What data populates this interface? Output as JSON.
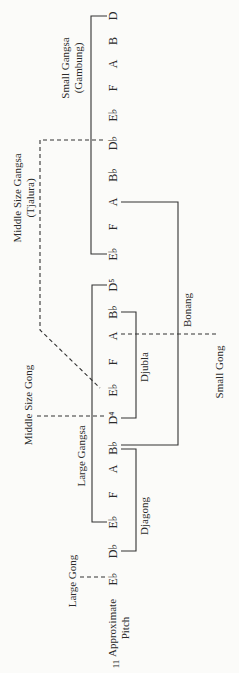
{
  "page_number": "11",
  "axis_label": [
    "Approximate",
    "Pitch"
  ],
  "pitch_column_x": 113,
  "pitches": [
    {
      "label": "D",
      "y": 16
    },
    {
      "label": "B",
      "y": 41
    },
    {
      "label": "A",
      "y": 64
    },
    {
      "label": "F",
      "y": 88
    },
    {
      "label": "E♭",
      "y": 115
    },
    {
      "label": "D♭",
      "y": 143
    },
    {
      "label": "B♭",
      "y": 175
    },
    {
      "label": "A",
      "y": 202
    },
    {
      "label": "F",
      "y": 227
    },
    {
      "label": "E♭",
      "y": 254
    },
    {
      "label": "D⁵",
      "y": 285
    },
    {
      "label": "B♭",
      "y": 312
    },
    {
      "label": "A",
      "y": 336
    },
    {
      "label": "F",
      "y": 362
    },
    {
      "label": "E♭",
      "y": 390
    },
    {
      "label": "D⁴",
      "y": 418
    },
    {
      "label": "B♭",
      "y": 448
    },
    {
      "label": "A",
      "y": 469
    },
    {
      "label": "F",
      "y": 495
    },
    {
      "label": "E♭",
      "y": 522
    },
    {
      "label": "D♭",
      "y": 551
    },
    {
      "label": "E♭",
      "y": 579
    }
  ],
  "instruments": {
    "small_gangsa": {
      "line1": "Small Gangsa",
      "line2": "(Gambung)",
      "range": "E♭ – D"
    },
    "middle_gangsa": {
      "line1": "Middle Size Gangsa",
      "line2": "(Tjalura)",
      "range": "D♭ – E♭ (dashed link)"
    },
    "large_gangsa": {
      "label": "Large Gangsa",
      "range": "E♭ – D⁵"
    },
    "bonang": {
      "label": "Bonang",
      "range": "B♭ – A"
    },
    "djubla": {
      "label": "Djubla",
      "range": "D⁴ – B♭"
    },
    "djagong": {
      "label": "Djagong",
      "range": "D♭ – B♭"
    },
    "small_gong": {
      "label": "Small Gong",
      "pitch": "A"
    },
    "middle_gong": {
      "label": "Middle Size Gong",
      "pitch": "D⁴"
    },
    "large_gong": {
      "label": "Large Gong",
      "pitch": "E♭"
    }
  }
}
